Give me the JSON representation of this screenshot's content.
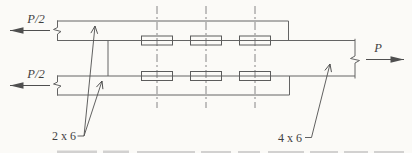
{
  "figure": {
    "type": "connection-detail-diagram",
    "loads": {
      "left_top": "P/2",
      "left_bottom": "P/2",
      "right": "P"
    },
    "member_labels": {
      "side_plates": "2 x 6",
      "main_member": "4 x 6"
    },
    "fasteners": {
      "rows": 2,
      "columns": 3,
      "centerlines": 3
    },
    "colors": {
      "background": "#fbfaf7",
      "member_line": "#646464",
      "centerline": "#787878",
      "text": "#3f3f3f"
    }
  }
}
